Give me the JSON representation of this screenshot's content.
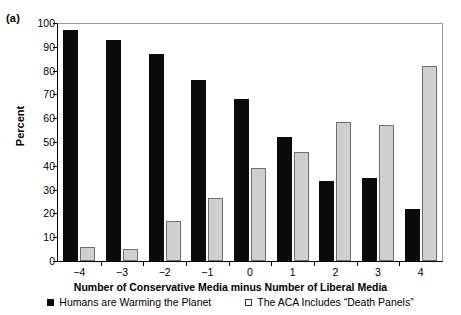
{
  "figure": {
    "panel_letter": "(a)"
  },
  "chart_data": {
    "type": "bar",
    "title": "",
    "xlabel": "Number of Conservative Media minus Number of Liberal Media",
    "ylabel": "Percent",
    "categories": [
      "−4",
      "−3",
      "−2",
      "−1",
      "0",
      "1",
      "2",
      "3",
      "4"
    ],
    "ylim": [
      0,
      100
    ],
    "yticks": [
      0,
      10,
      20,
      30,
      40,
      50,
      60,
      70,
      80,
      90,
      100
    ],
    "ytick_labels": [
      "0",
      "10",
      "20",
      "30",
      "40",
      "50",
      "60",
      "70",
      "80",
      "90",
      "100"
    ],
    "grid": false,
    "legend_position": "below",
    "series": [
      {
        "name": "Humans are Warming the Planet",
        "color": "#0a0a0a",
        "values": [
          97,
          93,
          87,
          76,
          68,
          52,
          33.5,
          35,
          22
        ]
      },
      {
        "name": "The ACA Includes “Death Panels”",
        "color": "#cfcfcf",
        "values": [
          6,
          5,
          17,
          26.5,
          39,
          46,
          58.5,
          57,
          82
        ]
      }
    ]
  }
}
